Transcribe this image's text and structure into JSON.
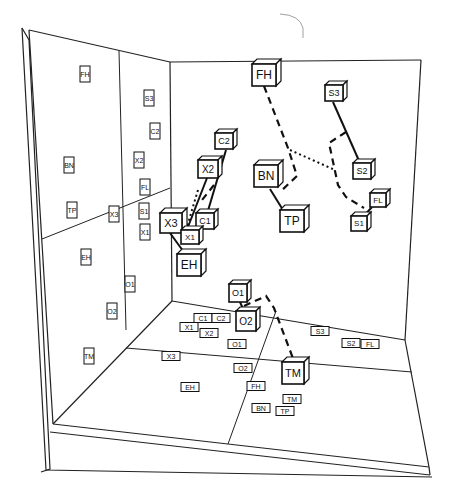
{
  "figure": {
    "right_wall_nodes": [
      {
        "label": "FH",
        "x": 252,
        "y": 64,
        "w": 24,
        "h": 22,
        "size": 12
      },
      {
        "label": "S3",
        "x": 325,
        "y": 85,
        "w": 18,
        "h": 16,
        "size": 9
      },
      {
        "label": "C2",
        "x": 215,
        "y": 133,
        "w": 18,
        "h": 16,
        "size": 9
      },
      {
        "label": "X2",
        "x": 198,
        "y": 160,
        "w": 20,
        "h": 18,
        "size": 10
      },
      {
        "label": "BN",
        "x": 254,
        "y": 165,
        "w": 24,
        "h": 22,
        "size": 12
      },
      {
        "label": "S2",
        "x": 353,
        "y": 163,
        "w": 18,
        "h": 16,
        "size": 9
      },
      {
        "label": "FL",
        "x": 370,
        "y": 193,
        "w": 16,
        "h": 14,
        "size": 8
      },
      {
        "label": "TP",
        "x": 280,
        "y": 210,
        "w": 24,
        "h": 22,
        "size": 12
      },
      {
        "label": "S1",
        "x": 351,
        "y": 216,
        "w": 16,
        "h": 15,
        "size": 8
      },
      {
        "label": "C1",
        "x": 196,
        "y": 213,
        "w": 18,
        "h": 16,
        "size": 9
      },
      {
        "label": "X3",
        "x": 160,
        "y": 213,
        "w": 22,
        "h": 20,
        "size": 11
      },
      {
        "label": "X1",
        "x": 181,
        "y": 230,
        "w": 18,
        "h": 14,
        "size": 8
      },
      {
        "label": "EH",
        "x": 177,
        "y": 254,
        "w": 24,
        "h": 22,
        "size": 12
      }
    ],
    "floor_cubes": [
      {
        "label": "O1",
        "x": 229,
        "y": 284,
        "w": 18,
        "h": 18,
        "size": 9
      },
      {
        "label": "O2",
        "x": 236,
        "y": 311,
        "w": 20,
        "h": 20,
        "size": 10
      },
      {
        "label": "TM",
        "x": 282,
        "y": 362,
        "w": 22,
        "h": 22,
        "size": 11
      }
    ],
    "left_wall_labels": [
      {
        "label": "FH",
        "x": 85,
        "y": 74
      },
      {
        "label": "S3",
        "x": 149,
        "y": 98
      },
      {
        "label": "C2",
        "x": 155,
        "y": 131
      },
      {
        "label": "X2",
        "x": 139,
        "y": 160
      },
      {
        "label": "BN",
        "x": 69,
        "y": 165
      },
      {
        "label": "FL",
        "x": 145,
        "y": 187
      },
      {
        "label": "TP",
        "x": 72,
        "y": 210
      },
      {
        "label": "X3",
        "x": 114,
        "y": 214
      },
      {
        "label": "S1",
        "x": 144,
        "y": 211
      },
      {
        "label": "X1",
        "x": 145,
        "y": 232
      },
      {
        "label": "EH",
        "x": 86,
        "y": 257
      },
      {
        "label": "O1",
        "x": 130,
        "y": 284
      },
      {
        "label": "O2",
        "x": 112,
        "y": 311
      },
      {
        "label": "TM",
        "x": 89,
        "y": 356
      }
    ],
    "floor_labels": [
      {
        "label": "C1",
        "x": 203,
        "y": 318
      },
      {
        "label": "C2",
        "x": 221,
        "y": 318
      },
      {
        "label": "X1",
        "x": 189,
        "y": 327
      },
      {
        "label": "X2",
        "x": 209,
        "y": 333
      },
      {
        "label": "O1",
        "x": 237,
        "y": 344
      },
      {
        "label": "X3",
        "x": 171,
        "y": 356
      },
      {
        "label": "O2",
        "x": 243,
        "y": 368
      },
      {
        "label": "EH",
        "x": 190,
        "y": 387
      },
      {
        "label": "FH",
        "x": 256,
        "y": 386
      },
      {
        "label": "TM",
        "x": 292,
        "y": 399
      },
      {
        "label": "BN",
        "x": 261,
        "y": 408
      },
      {
        "label": "TP",
        "x": 285,
        "y": 411
      },
      {
        "label": "S3",
        "x": 320,
        "y": 331
      },
      {
        "label": "S2",
        "x": 351,
        "y": 343
      },
      {
        "label": "FL",
        "x": 370,
        "y": 344
      }
    ]
  }
}
